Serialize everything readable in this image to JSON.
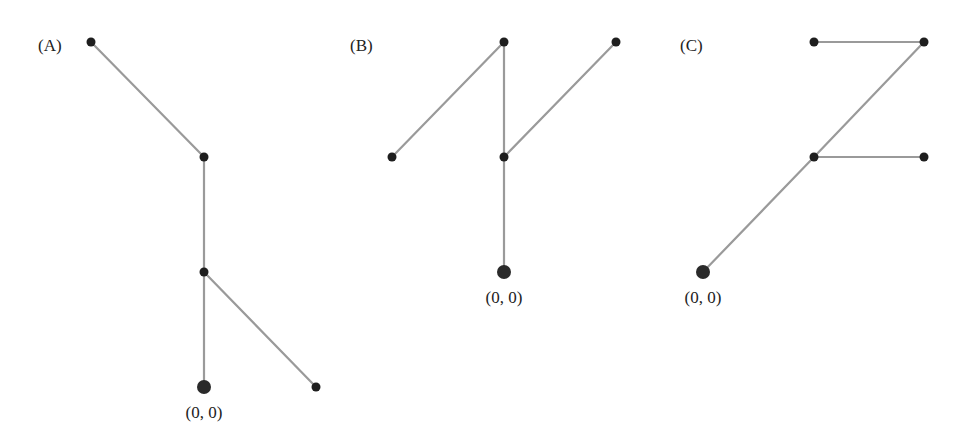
{
  "figure": {
    "panels": [
      {
        "label": "(A)",
        "label_pos": [
          38,
          51
        ],
        "root_label": "(0, 0)",
        "root_label_pos": [
          204,
          418
        ],
        "nodes": [
          {
            "id": "root",
            "x": 204,
            "y": 387,
            "root": true
          },
          {
            "id": "n1",
            "x": 204,
            "y": 272
          },
          {
            "id": "n2",
            "x": 204,
            "y": 157
          },
          {
            "id": "n3",
            "x": 91,
            "y": 42
          },
          {
            "id": "n4",
            "x": 316,
            "y": 387
          }
        ],
        "edges": [
          [
            "root",
            "n1"
          ],
          [
            "n1",
            "n2"
          ],
          [
            "n2",
            "n3"
          ],
          [
            "n1",
            "n4"
          ]
        ]
      },
      {
        "label": "(B)",
        "label_pos": [
          350,
          51
        ],
        "root_label": "(0, 0)",
        "root_label_pos": [
          504,
          303
        ],
        "nodes": [
          {
            "id": "root",
            "x": 504,
            "y": 272,
            "root": true
          },
          {
            "id": "n1",
            "x": 504,
            "y": 157
          },
          {
            "id": "n2",
            "x": 504,
            "y": 42
          },
          {
            "id": "n3",
            "x": 392,
            "y": 157
          },
          {
            "id": "n4",
            "x": 616,
            "y": 42
          }
        ],
        "edges": [
          [
            "root",
            "n1"
          ],
          [
            "n1",
            "n2"
          ],
          [
            "n2",
            "n3"
          ],
          [
            "n1",
            "n4"
          ]
        ]
      },
      {
        "label": "(C)",
        "label_pos": [
          680,
          51
        ],
        "root_label": "(0, 0)",
        "root_label_pos": [
          703,
          303
        ],
        "nodes": [
          {
            "id": "root",
            "x": 703,
            "y": 272,
            "root": true
          },
          {
            "id": "n1",
            "x": 814,
            "y": 157
          },
          {
            "id": "n2",
            "x": 924,
            "y": 157
          },
          {
            "id": "n3",
            "x": 924,
            "y": 42
          },
          {
            "id": "n4",
            "x": 814,
            "y": 42
          }
        ],
        "edges": [
          [
            "root",
            "n1"
          ],
          [
            "n1",
            "n2"
          ],
          [
            "n1",
            "n3"
          ],
          [
            "n3",
            "n4"
          ]
        ]
      }
    ],
    "colors": {
      "edge": "#9a9a9a",
      "node": "#1e1e1e",
      "text": "#222222",
      "background": "#ffffff"
    }
  }
}
